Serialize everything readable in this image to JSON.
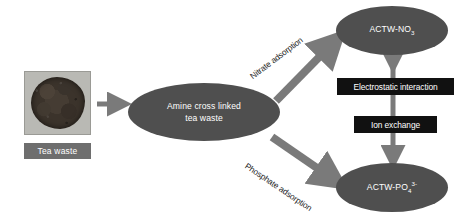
{
  "diagram": {
    "type": "process-flow",
    "title_text": "",
    "colors": {
      "ellipse_fill": "#4f4f4f",
      "ellipse_text": "#ffffff",
      "arrow_gray": "#7a7a7a",
      "label_box_black": "#111111",
      "caption_box_gray": "#6e6e6e",
      "background": "#ffffff"
    },
    "photo": {
      "caption": "Tea waste",
      "alt_name": "tea-waste-powder-photo"
    },
    "nodes": [
      {
        "id": "center",
        "label_line1": "Amine cross linked",
        "label_line2": "tea waste"
      },
      {
        "id": "nitrate_product",
        "label_prefix": "ACTW-NO",
        "label_sub": "3",
        "label_sup": ""
      },
      {
        "id": "phosphate_product",
        "label_prefix": "ACTW-PO",
        "label_sub": "4",
        "label_sup": "3-"
      }
    ],
    "arrow_labels": {
      "nitrate": "Nitrate adsorption",
      "phosphate": "Phosphate adsorption"
    },
    "mechanism_boxes": [
      {
        "id": "electrostatic",
        "label": "Electrostatic interaction"
      },
      {
        "id": "ion_exchange",
        "label": "Ion exchange"
      }
    ]
  }
}
